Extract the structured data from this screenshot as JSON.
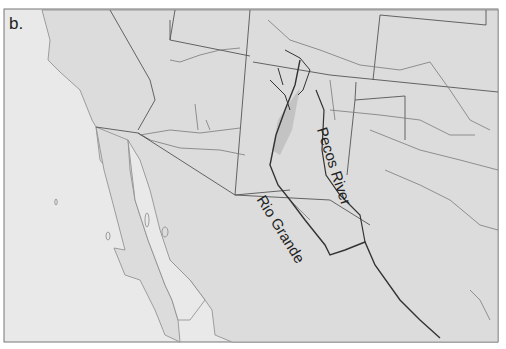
{
  "panel_label": "b.",
  "map": {
    "region": "Southwestern United States and Northern Mexico",
    "labels": [
      {
        "id": "pecos",
        "text": "Pecos River"
      },
      {
        "id": "rio",
        "text": "Rio Grande"
      }
    ],
    "colors": {
      "ocean": "#e9e9e9",
      "land": "#dcdcdc",
      "border": "#555555",
      "river_main": "#333333",
      "river_minor": "#7a7a7a",
      "basin_shade": "#bdbdbd"
    }
  }
}
